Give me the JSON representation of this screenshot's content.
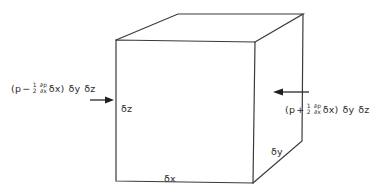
{
  "figure": {
    "type": "cube-control-volume",
    "edge_color": "#3a3a3a",
    "vertices": {
      "front_top_left": [
        116,
        40
      ],
      "front_top_right": [
        255,
        42
      ],
      "front_bottom_left": [
        116,
        181
      ],
      "front_bottom_right": [
        253,
        183
      ],
      "back_top_left": [
        178,
        14
      ],
      "back_top_right": [
        303,
        14
      ],
      "back_bottom_right": [
        302,
        141
      ]
    },
    "dimension_labels": {
      "dz": "δz",
      "dx": "δx",
      "dy": "δy"
    },
    "left_force": {
      "open": "(p",
      "sign": "−",
      "coef_num": "1",
      "coef_den": "2",
      "deriv_num": "∂p",
      "deriv_den": "∂x",
      "tail": "δx)",
      "area1": "δy",
      "area2": "δz",
      "direction": "right"
    },
    "right_force": {
      "open": "(p",
      "sign": "+",
      "coef_num": "1",
      "coef_den": "2",
      "deriv_num": "∂p",
      "deriv_den": "∂x",
      "tail": "δx)",
      "area1": "δy",
      "area2": "δz",
      "direction": "left"
    }
  }
}
